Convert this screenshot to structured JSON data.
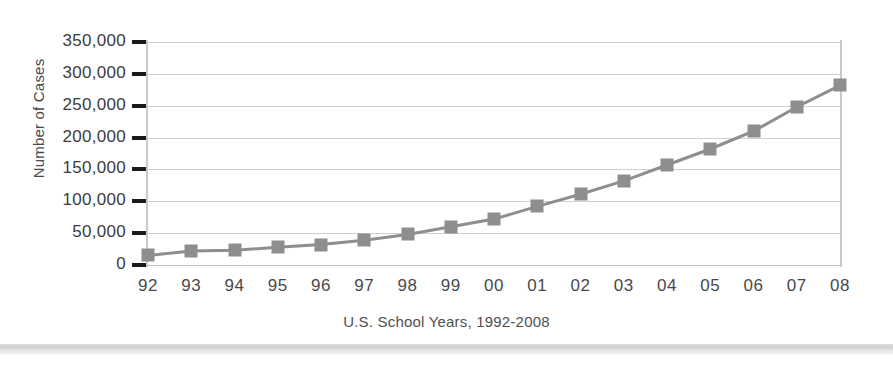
{
  "chart_data": {
    "type": "line",
    "title": "",
    "xlabel": "U.S. School Years, 1992-2008",
    "ylabel": "Number of Cases",
    "categories": [
      "92",
      "93",
      "94",
      "95",
      "96",
      "97",
      "98",
      "99",
      "00",
      "01",
      "02",
      "03",
      "04",
      "05",
      "06",
      "07",
      "08"
    ],
    "values": [
      15000,
      22000,
      23000,
      28000,
      32000,
      39000,
      48000,
      60000,
      72000,
      92000,
      111000,
      132000,
      157000,
      182000,
      210000,
      248000,
      282000
    ],
    "ylim": [
      0,
      350000
    ],
    "yticks": [
      0,
      50000,
      100000,
      150000,
      200000,
      250000,
      300000,
      350000
    ],
    "ytick_labels": [
      "0",
      "50,000",
      "100,000",
      "150,000",
      "200,000",
      "250,000",
      "300,000",
      "350,000"
    ],
    "grid": true,
    "legend": "none",
    "series_color": "#8e8e8e",
    "gridline_color": "#cfcfcf",
    "marker": "square"
  }
}
